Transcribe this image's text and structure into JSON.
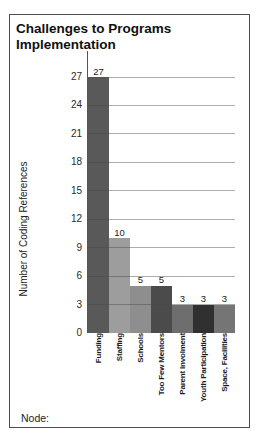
{
  "panel": {
    "title": "Challenges to Programs\nImplementation",
    "node_label": "Node:"
  },
  "chart_data": {
    "type": "bar",
    "title": "Challenges to Programs Implementation",
    "categories": [
      "Funding",
      "Staffing",
      "Schools",
      "Too Few Mentors",
      "Parent Involment",
      "Youth Participation",
      "Space, Facilities"
    ],
    "values": [
      27,
      10,
      5,
      5,
      3,
      3,
      3
    ],
    "bar_colors": [
      "#595959",
      "#9d9d9d",
      "#8e8e8e",
      "#4b4b4b",
      "#6e6e6e",
      "#303030",
      "#757575"
    ],
    "xlabel": "",
    "ylabel": "Number of Coding References",
    "ylim": [
      0,
      27
    ],
    "yticks": [
      0,
      3,
      6,
      9,
      12,
      15,
      18,
      21,
      24,
      27
    ],
    "grid": "horizontal",
    "data_labels": true,
    "legend": "none"
  }
}
